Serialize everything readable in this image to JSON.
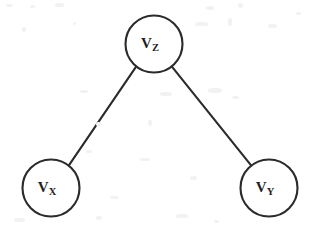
{
  "figure": {
    "kind": "undirected-graph-diagram",
    "width": 313,
    "height": 227,
    "background_color": "#ffffff",
    "stroke_color": "#2b2b2b",
    "label_color": "#1f1f1f",
    "stroke_width": 2.1,
    "node_radius": 28.5
  },
  "nodes": [
    {
      "id": "vz",
      "name": "node-vz",
      "base_label": "V",
      "subscript_label": "Z",
      "full_label": "VZ",
      "cx": 154,
      "cy": 44,
      "r": 28.5
    },
    {
      "id": "vx",
      "name": "node-vx",
      "base_label": "V",
      "subscript_label": "X",
      "full_label": "VX",
      "cx": 51,
      "cy": 188,
      "r": 28.5
    },
    {
      "id": "vy",
      "name": "node-vy",
      "base_label": "V",
      "subscript_label": "Y",
      "full_label": "VY",
      "cx": 269,
      "cy": 188,
      "r": 28.5
    }
  ],
  "edges": [
    {
      "id": "edge-vz-vx",
      "name": "edge-vz-vx",
      "from": "vz",
      "to": "vx",
      "x1": 136.3,
      "y1": 66.3,
      "x2": 68.7,
      "y2": 165.7
    },
    {
      "id": "edge-vz-vy",
      "name": "edge-vz-vy",
      "from": "vz",
      "to": "vy",
      "x1": 171.7,
      "y1": 66.3,
      "x2": 251.3,
      "y2": 165.7
    }
  ],
  "scan_specks": [
    {
      "x": 6,
      "y": 4,
      "w": 7,
      "h": 3
    },
    {
      "x": 30,
      "y": 5,
      "w": 5,
      "h": 3
    },
    {
      "x": 55,
      "y": 3,
      "w": 9,
      "h": 4
    },
    {
      "x": 22,
      "y": 27,
      "w": 4,
      "h": 5
    },
    {
      "x": 73,
      "y": 22,
      "w": 3,
      "h": 3
    },
    {
      "x": 206,
      "y": 6,
      "w": 8,
      "h": 4
    },
    {
      "x": 238,
      "y": 3,
      "w": 5,
      "h": 5
    },
    {
      "x": 195,
      "y": 22,
      "w": 13,
      "h": 4
    },
    {
      "x": 228,
      "y": 18,
      "w": 4,
      "h": 8
    },
    {
      "x": 268,
      "y": 24,
      "w": 9,
      "h": 4
    },
    {
      "x": 296,
      "y": 12,
      "w": 5,
      "h": 3
    },
    {
      "x": 80,
      "y": 90,
      "w": 8,
      "h": 3
    },
    {
      "x": 160,
      "y": 92,
      "w": 12,
      "h": 4
    },
    {
      "x": 208,
      "y": 88,
      "w": 14,
      "h": 5
    },
    {
      "x": 232,
      "y": 96,
      "w": 7,
      "h": 3
    },
    {
      "x": 96,
      "y": 122,
      "w": 5,
      "h": 4
    },
    {
      "x": 148,
      "y": 120,
      "w": 4,
      "h": 6
    },
    {
      "x": 86,
      "y": 150,
      "w": 6,
      "h": 3
    },
    {
      "x": 140,
      "y": 158,
      "w": 10,
      "h": 3
    },
    {
      "x": 190,
      "y": 176,
      "w": 7,
      "h": 4
    },
    {
      "x": 110,
      "y": 196,
      "w": 9,
      "h": 3
    },
    {
      "x": 14,
      "y": 218,
      "w": 11,
      "h": 4
    },
    {
      "x": 96,
      "y": 216,
      "w": 6,
      "h": 4
    },
    {
      "x": 176,
      "y": 214,
      "w": 12,
      "h": 4
    },
    {
      "x": 214,
      "y": 220,
      "w": 5,
      "h": 3
    }
  ]
}
